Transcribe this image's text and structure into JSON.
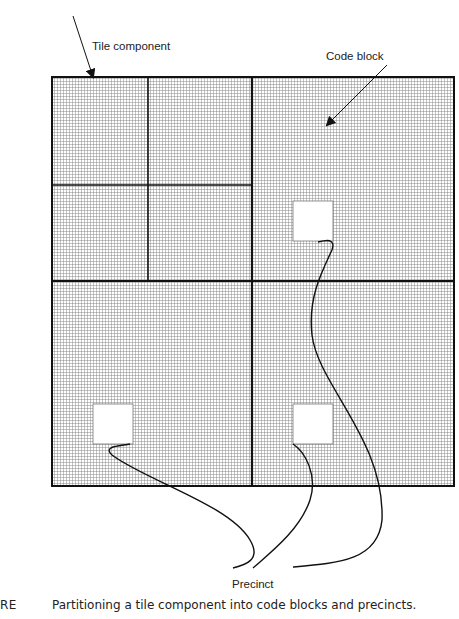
{
  "diagram": {
    "labels": {
      "tile_component": "Tile component",
      "code_block": "Code block",
      "precinct": "Precinct"
    },
    "caption": {
      "tag": "RE",
      "text": "Partitioning a tile component into code blocks and precincts."
    },
    "structure": {
      "tile_component": {
        "x": 52,
        "y": 77,
        "w": 402,
        "h": 409
      },
      "subbands": [
        {
          "name": "LL",
          "x": 52,
          "y": 77,
          "w": 96,
          "h": 108
        },
        {
          "name": "HL-2",
          "x": 148,
          "y": 77,
          "w": 104,
          "h": 108
        },
        {
          "name": "LH-2",
          "x": 52,
          "y": 185,
          "w": 96,
          "h": 96
        },
        {
          "name": "HH-2",
          "x": 148,
          "y": 185,
          "w": 104,
          "h": 96
        },
        {
          "name": "HL-1",
          "x": 252,
          "y": 77,
          "w": 202,
          "h": 204
        },
        {
          "name": "LH-1",
          "x": 52,
          "y": 281,
          "w": 200,
          "h": 205
        },
        {
          "name": "HH-1",
          "x": 252,
          "y": 281,
          "w": 202,
          "h": 205
        }
      ],
      "precincts": [
        {
          "x": 293,
          "y": 201,
          "w": 40,
          "h": 40
        },
        {
          "x": 93,
          "y": 404,
          "w": 40,
          "h": 40
        },
        {
          "x": 293,
          "y": 404,
          "w": 40,
          "h": 40
        }
      ]
    },
    "colors": {
      "line": "#111111",
      "grid": "#8a8a8a",
      "background": "#ffffff"
    }
  }
}
